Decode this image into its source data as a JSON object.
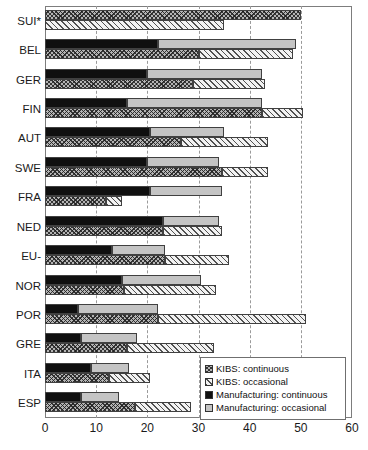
{
  "chart_data": {
    "type": "bar",
    "orientation": "horizontal",
    "stacked": true,
    "title": "",
    "xlabel": "",
    "ylabel": "",
    "xlim": [
      0,
      60
    ],
    "xticks": [
      0,
      10,
      20,
      30,
      40,
      50,
      60
    ],
    "grid": "vertical-dashed",
    "legend_position": "inside-bottom-right",
    "categories": [
      "SUI*",
      "BEL",
      "GER",
      "FIN",
      "AUT",
      "SWE",
      "FRA",
      "NED",
      "EU-",
      "NOR",
      "POR",
      "GRE",
      "ITA",
      "ESP"
    ],
    "series": [
      {
        "name": "KIBS: continuous",
        "key": "kibs_continuous",
        "color": "#b4b4b4",
        "pattern": "cross-hatch",
        "values": [
          50.0,
          30.0,
          29.0,
          42.5,
          26.5,
          34.5,
          12.0,
          23.0,
          23.5,
          15.5,
          22.0,
          16.0,
          12.5,
          17.5
        ]
      },
      {
        "name": "KIBS: occasional",
        "key": "kibs_occasional",
        "color": "#f2f2f2",
        "pattern": "diagonal-hatch",
        "values": [
          35.0,
          18.5,
          14.0,
          8.0,
          17.0,
          9.0,
          3.0,
          11.5,
          12.5,
          18.0,
          29.0,
          17.0,
          8.0,
          11.0
        ]
      },
      {
        "name": "Manufacturing: continuous",
        "key": "manufacturing_continuous",
        "color": "#101010",
        "pattern": "solid",
        "values": [
          null,
          22.0,
          20.0,
          16.0,
          20.5,
          20.0,
          20.5,
          23.0,
          13.0,
          15.0,
          6.5,
          7.0,
          9.0,
          7.0
        ]
      },
      {
        "name": "Manufacturing: occasional",
        "key": "manufacturing_occasional",
        "color": "#c4c4c4",
        "pattern": "solid-gray",
        "values": [
          null,
          27.0,
          22.5,
          26.5,
          14.5,
          14.0,
          14.0,
          11.0,
          10.5,
          15.5,
          15.5,
          11.0,
          7.5,
          7.5
        ]
      }
    ],
    "totals": {
      "kibs": [
        85.0,
        48.5,
        43.0,
        50.5,
        43.5,
        43.5,
        15.0,
        34.5,
        36.0,
        33.5,
        51.0,
        33.0,
        20.5,
        28.5
      ],
      "manufacturing": [
        null,
        49.0,
        42.5,
        42.5,
        35.0,
        34.0,
        34.5,
        34.0,
        23.5,
        30.5,
        22.0,
        18.0,
        16.5,
        14.5
      ]
    }
  },
  "legend": {
    "items": [
      {
        "label": "KIBS: continuous",
        "swatch": "cross-hatch"
      },
      {
        "label": "KIBS: occasional",
        "swatch": "diagonal-hatch"
      },
      {
        "label": "Manufacturing: continuous",
        "swatch": "solid-black"
      },
      {
        "label": "Manufacturing: occasional",
        "swatch": "solid-gray"
      }
    ]
  }
}
